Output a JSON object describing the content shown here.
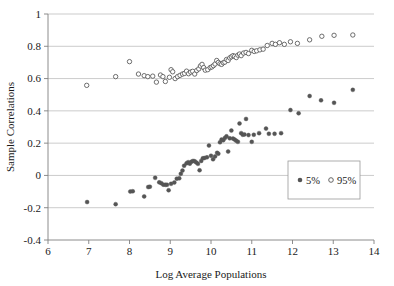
{
  "chart_data": {
    "type": "scatter",
    "title": "",
    "xlabel": "Log Average Populations",
    "ylabel": "Sample Correlations",
    "xlim": [
      6,
      14
    ],
    "ylim": [
      -0.4,
      1
    ],
    "xticks": [
      6,
      7,
      8,
      9,
      10,
      11,
      12,
      13,
      14
    ],
    "yticks": [
      -0.4,
      -0.2,
      0,
      0.2,
      0.4,
      0.6,
      0.8,
      1
    ],
    "xtick_labels": [
      "6",
      "7",
      "8",
      "9",
      "10",
      "11",
      "12",
      "13",
      "14"
    ],
    "ytick_labels": [
      "-0.4",
      "-0.2",
      "0",
      "0.2",
      "0.4",
      "0.6",
      "0.8",
      "1"
    ],
    "grid": "horizontal",
    "legend_position": "lower-right-inside",
    "marker_color": "#555555",
    "gridline_color": "#b4b4b4",
    "axis_color": "#808080",
    "series": [
      {
        "name": "5%",
        "marker": "filled-circle",
        "color": "#555555",
        "points": [
          [
            6.96,
            -0.165
          ],
          [
            7.66,
            -0.178
          ],
          [
            8.02,
            -0.1
          ],
          [
            8.08,
            -0.098
          ],
          [
            8.36,
            -0.13
          ],
          [
            8.46,
            -0.072
          ],
          [
            8.5,
            -0.07
          ],
          [
            8.63,
            -0.015
          ],
          [
            8.73,
            -0.043
          ],
          [
            8.78,
            -0.048
          ],
          [
            8.83,
            -0.057
          ],
          [
            8.88,
            -0.058
          ],
          [
            8.92,
            -0.058
          ],
          [
            8.96,
            -0.092
          ],
          [
            9.02,
            -0.052
          ],
          [
            9.1,
            -0.044
          ],
          [
            9.16,
            -0.02
          ],
          [
            9.22,
            -0.018
          ],
          [
            9.26,
            0.01
          ],
          [
            9.3,
            0.03
          ],
          [
            9.34,
            0.06
          ],
          [
            9.4,
            0.075
          ],
          [
            9.44,
            0.082
          ],
          [
            9.48,
            0.073
          ],
          [
            9.52,
            0.085
          ],
          [
            9.56,
            0.09
          ],
          [
            9.6,
            0.088
          ],
          [
            9.64,
            0.08
          ],
          [
            9.68,
            0.072
          ],
          [
            9.72,
            0.032
          ],
          [
            9.76,
            0.09
          ],
          [
            9.8,
            0.106
          ],
          [
            9.84,
            0.108
          ],
          [
            9.9,
            0.112
          ],
          [
            9.95,
            0.185
          ],
          [
            10.0,
            0.122
          ],
          [
            10.05,
            0.1
          ],
          [
            10.1,
            0.118
          ],
          [
            10.15,
            0.14
          ],
          [
            10.18,
            0.135
          ],
          [
            10.22,
            0.205
          ],
          [
            10.26,
            0.222
          ],
          [
            10.3,
            0.218
          ],
          [
            10.34,
            0.232
          ],
          [
            10.38,
            0.242
          ],
          [
            10.42,
            0.148
          ],
          [
            10.46,
            0.23
          ],
          [
            10.5,
            0.278
          ],
          [
            10.54,
            0.228
          ],
          [
            10.58,
            0.222
          ],
          [
            10.62,
            0.215
          ],
          [
            10.66,
            0.208
          ],
          [
            10.7,
            0.322
          ],
          [
            10.74,
            0.262
          ],
          [
            10.78,
            0.252
          ],
          [
            10.82,
            0.254
          ],
          [
            10.86,
            0.35
          ],
          [
            10.92,
            0.25
          ],
          [
            11.0,
            0.208
          ],
          [
            11.05,
            0.252
          ],
          [
            11.18,
            0.262
          ],
          [
            11.35,
            0.29
          ],
          [
            11.42,
            0.258
          ],
          [
            11.56,
            0.258
          ],
          [
            11.72,
            0.262
          ],
          [
            11.95,
            0.405
          ],
          [
            12.15,
            0.385
          ],
          [
            12.42,
            0.492
          ],
          [
            12.7,
            0.465
          ],
          [
            13.02,
            0.45
          ],
          [
            13.48,
            0.53
          ]
        ]
      },
      {
        "name": "95%",
        "marker": "open-circle",
        "color": "#555555",
        "points": [
          [
            6.95,
            0.558
          ],
          [
            7.66,
            0.612
          ],
          [
            8.0,
            0.705
          ],
          [
            8.22,
            0.628
          ],
          [
            8.36,
            0.618
          ],
          [
            8.45,
            0.612
          ],
          [
            8.57,
            0.615
          ],
          [
            8.66,
            0.578
          ],
          [
            8.76,
            0.622
          ],
          [
            8.82,
            0.612
          ],
          [
            8.88,
            0.582
          ],
          [
            8.98,
            0.608
          ],
          [
            9.02,
            0.655
          ],
          [
            9.06,
            0.642
          ],
          [
            9.12,
            0.6
          ],
          [
            9.18,
            0.612
          ],
          [
            9.24,
            0.62
          ],
          [
            9.3,
            0.628
          ],
          [
            9.35,
            0.632
          ],
          [
            9.4,
            0.646
          ],
          [
            9.45,
            0.63
          ],
          [
            9.5,
            0.64
          ],
          [
            9.55,
            0.645
          ],
          [
            9.6,
            0.628
          ],
          [
            9.65,
            0.65
          ],
          [
            9.7,
            0.66
          ],
          [
            9.74,
            0.678
          ],
          [
            9.78,
            0.688
          ],
          [
            9.82,
            0.668
          ],
          [
            9.86,
            0.652
          ],
          [
            9.92,
            0.655
          ],
          [
            9.98,
            0.668
          ],
          [
            10.02,
            0.672
          ],
          [
            10.06,
            0.68
          ],
          [
            10.1,
            0.69
          ],
          [
            10.14,
            0.712
          ],
          [
            10.18,
            0.7
          ],
          [
            10.22,
            0.692
          ],
          [
            10.26,
            0.688
          ],
          [
            10.3,
            0.698
          ],
          [
            10.34,
            0.702
          ],
          [
            10.38,
            0.718
          ],
          [
            10.42,
            0.712
          ],
          [
            10.46,
            0.728
          ],
          [
            10.5,
            0.735
          ],
          [
            10.54,
            0.742
          ],
          [
            10.58,
            0.738
          ],
          [
            10.62,
            0.73
          ],
          [
            10.66,
            0.745
          ],
          [
            10.7,
            0.752
          ],
          [
            10.74,
            0.742
          ],
          [
            10.8,
            0.758
          ],
          [
            10.86,
            0.762
          ],
          [
            10.92,
            0.755
          ],
          [
            11.0,
            0.775
          ],
          [
            11.06,
            0.768
          ],
          [
            11.12,
            0.772
          ],
          [
            11.2,
            0.778
          ],
          [
            11.28,
            0.782
          ],
          [
            11.38,
            0.805
          ],
          [
            11.5,
            0.818
          ],
          [
            11.58,
            0.812
          ],
          [
            11.68,
            0.822
          ],
          [
            11.8,
            0.812
          ],
          [
            11.95,
            0.828
          ],
          [
            12.12,
            0.818
          ],
          [
            12.42,
            0.84
          ],
          [
            12.72,
            0.862
          ],
          [
            13.02,
            0.868
          ],
          [
            13.48,
            0.87
          ]
        ]
      }
    ]
  },
  "legend": {
    "entries": [
      {
        "label": "5%",
        "marker": "filled-circle"
      },
      {
        "label": "95%",
        "marker": "open-circle"
      }
    ]
  }
}
